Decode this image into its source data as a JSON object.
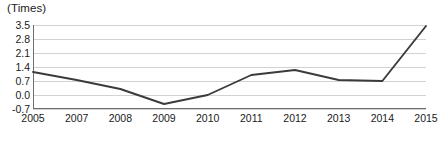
{
  "chart_data": {
    "type": "line",
    "title": "",
    "subtitle": "",
    "unit_label": "(Times)",
    "xlabel": "",
    "ylabel": "",
    "categories": [
      "2005",
      "2007",
      "2008",
      "2009",
      "2010",
      "2011",
      "2012",
      "2013",
      "2014",
      "2015"
    ],
    "series": [
      {
        "name": "Times",
        "values": [
          1.15,
          0.75,
          0.3,
          -0.45,
          0.0,
          1.0,
          1.25,
          0.75,
          0.7,
          3.45
        ]
      }
    ],
    "ylim": [
      -0.7,
      3.5
    ],
    "yticks": [
      "3.5",
      "2.8",
      "2.1",
      "1.4",
      "0.7",
      "0.0",
      "-0.7"
    ],
    "ytick_values": [
      3.5,
      2.8,
      2.1,
      1.4,
      0.7,
      0.0,
      -0.7
    ],
    "grid": true,
    "grid_axis": "y",
    "legend": false,
    "legend_position": "none",
    "line_color": "#3b3b3b",
    "grid_color": "#d2d2d2",
    "axis_color": "#6e6e6e",
    "text_color": "#1a1a1a",
    "background_color": "#ffffff"
  }
}
